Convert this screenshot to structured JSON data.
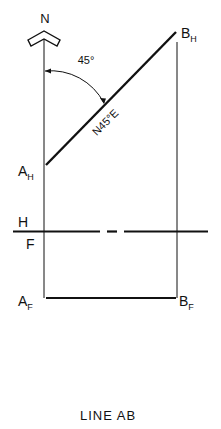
{
  "diagram": {
    "title": "LINE AB",
    "north_label": "N",
    "angle_label": "45°",
    "bearing_label": "N45°E",
    "points": {
      "a_h": {
        "main": "A",
        "sub": "H"
      },
      "b_h": {
        "main": "B",
        "sub": "H"
      },
      "a_f": {
        "main": "A",
        "sub": "F"
      },
      "b_f": {
        "main": "B",
        "sub": "F"
      }
    },
    "fold_line": {
      "upper": "H",
      "lower": "F"
    },
    "colors": {
      "ink": "#111111",
      "background": "#ffffff"
    }
  }
}
